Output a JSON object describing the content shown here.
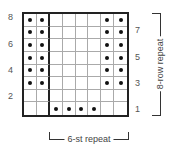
{
  "chart": {
    "columns": 8,
    "rows": 8,
    "legend_symbol": "dot",
    "cells": [
      [
        1,
        1,
        0,
        0,
        0,
        0,
        1,
        1
      ],
      [
        1,
        1,
        0,
        0,
        0,
        0,
        1,
        1
      ],
      [
        1,
        1,
        0,
        0,
        0,
        0,
        1,
        1
      ],
      [
        1,
        1,
        0,
        0,
        0,
        0,
        1,
        1
      ],
      [
        1,
        1,
        0,
        0,
        0,
        0,
        1,
        1
      ],
      [
        1,
        1,
        0,
        0,
        0,
        0,
        1,
        1
      ],
      [
        0,
        0,
        0,
        0,
        0,
        0,
        0,
        0
      ],
      [
        0,
        0,
        1,
        1,
        1,
        1,
        0,
        0
      ]
    ],
    "cells_note": "rows listed top (row 8) to bottom (row 1); 1 = dot symbol",
    "repeat_divider_after_column": 2
  },
  "labels": {
    "left_rows": [
      "8",
      "6",
      "4",
      "2"
    ],
    "right_rows": [
      "7",
      "5",
      "3",
      "1"
    ],
    "row_repeat": "8-row repeat",
    "stitch_repeat": "6-st repeat"
  }
}
